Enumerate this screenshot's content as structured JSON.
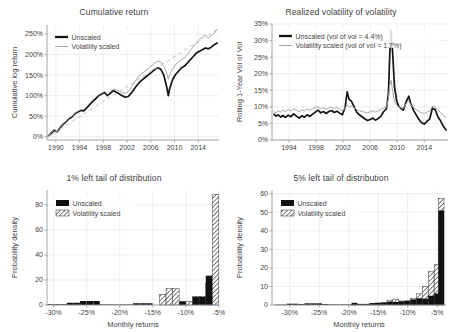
{
  "figure": {
    "panels": [
      "cumulative-return",
      "realized-vol-of-vol",
      "tail-1pct",
      "tail-5pct"
    ]
  },
  "panel_tl": {
    "title": "Cumulative return",
    "ylabel": "Cumulative log return",
    "xlabel": "",
    "legend": [
      "Unscaled",
      "Volatility scaled"
    ],
    "yticks": [
      "0%",
      "50%",
      "100%",
      "150%",
      "200%",
      "250%"
    ],
    "xticks": [
      "1990",
      "1994",
      "1998",
      "2002",
      "2006",
      "2010",
      "2014"
    ]
  },
  "panel_tr": {
    "title": "Realized volatility of volatility",
    "ylabel": "Rolling 1-Year Vol of Vol",
    "xlabel": "",
    "legend": [
      "Unscaled (vol of vol = 4.4%)",
      "Volatility scaled (vol of vol = 1.7%)"
    ],
    "yticks": [
      "0%",
      "5%",
      "10%",
      "15%",
      "20%",
      "25%",
      "30%",
      "35%"
    ],
    "xticks": [
      "1994",
      "1998",
      "2002",
      "2006",
      "2010",
      "2014"
    ]
  },
  "panel_bl": {
    "title": "1% left tail of distribution",
    "ylabel": "Probability density",
    "xlabel": "Monthly returns",
    "legend": [
      "Unscaled",
      "Volatility scaled"
    ],
    "yticks": [
      "0",
      "20",
      "40",
      "60",
      "80"
    ],
    "xticks": [
      "-30%",
      "-25%",
      "-20%",
      "-15%",
      "-10%",
      "-5%"
    ]
  },
  "panel_br": {
    "title": "5% left tail of distribution",
    "ylabel": "Probability density",
    "xlabel": "Monthly returns",
    "legend": [
      "Unscaled",
      "Volatility scaled"
    ],
    "yticks": [
      "0",
      "10",
      "20",
      "30",
      "40",
      "50",
      "60"
    ],
    "xticks": [
      "-30%",
      "-25%",
      "-20%",
      "-15%",
      "-10%",
      "-5%"
    ]
  },
  "chart_data": [
    {
      "id": "cumulative-return",
      "type": "line",
      "title": "Cumulative return",
      "xlabel": "",
      "ylabel": "Cumulative log return",
      "xlim": [
        1988.5,
        2017.5
      ],
      "ylim": [
        -8,
        272
      ],
      "xticks": [
        1990,
        1994,
        1998,
        2002,
        2006,
        2010,
        2014
      ],
      "yticks": [
        0,
        50,
        100,
        150,
        200,
        250
      ],
      "ytick_labels": [
        "0%",
        "50%",
        "100%",
        "150%",
        "200%",
        "250%"
      ],
      "grid": true,
      "legend_position": "upper-left",
      "series": [
        {
          "name": "Unscaled",
          "color": "#131313",
          "x": [
            1988.7,
            1989.2,
            1989.7,
            1990.2,
            1990.7,
            1991.2,
            1991.7,
            1992.2,
            1992.7,
            1993.2,
            1993.7,
            1994.2,
            1994.7,
            1995.2,
            1995.7,
            1996.2,
            1996.7,
            1997.2,
            1997.7,
            1998.2,
            1998.7,
            1999.2,
            1999.7,
            2000.2,
            2000.7,
            2001.2,
            2001.7,
            2002.2,
            2002.7,
            2003.2,
            2003.7,
            2004.2,
            2004.7,
            2005.2,
            2005.7,
            2006.2,
            2006.7,
            2007.2,
            2007.7,
            2008.2,
            2008.7,
            2008.95,
            2009.2,
            2009.7,
            2010.2,
            2010.7,
            2011.2,
            2011.7,
            2012.2,
            2012.7,
            2013.2,
            2013.7,
            2014.2,
            2014.7,
            2015.2,
            2015.7,
            2016.2,
            2016.7,
            2017.2
          ],
          "y": [
            2,
            8,
            16,
            12,
            22,
            30,
            36,
            44,
            48,
            56,
            60,
            64,
            63,
            70,
            78,
            86,
            92,
            100,
            104,
            108,
            100,
            106,
            112,
            108,
            104,
            100,
            96,
            98,
            106,
            116,
            126,
            134,
            140,
            146,
            152,
            158,
            164,
            168,
            164,
            150,
            120,
            100,
            118,
            140,
            152,
            160,
            168,
            172,
            180,
            188,
            196,
            204,
            208,
            212,
            216,
            214,
            218,
            224,
            228
          ]
        },
        {
          "name": "Volatility scaled",
          "color": "#a8a8a8",
          "x": [
            1988.7,
            1989.2,
            1989.7,
            1990.2,
            1990.7,
            1991.2,
            1991.7,
            1992.2,
            1992.7,
            1993.2,
            1993.7,
            1994.2,
            1994.7,
            1995.2,
            1995.7,
            1996.2,
            1996.7,
            1997.2,
            1997.7,
            1998.2,
            1998.7,
            1999.2,
            1999.7,
            2000.2,
            2000.7,
            2001.2,
            2001.7,
            2002.2,
            2002.7,
            2003.2,
            2003.7,
            2004.2,
            2004.7,
            2005.2,
            2005.7,
            2006.2,
            2006.7,
            2007.2,
            2007.7,
            2008.2,
            2008.7,
            2008.95,
            2009.2,
            2009.7,
            2010.2,
            2010.7,
            2011.2,
            2011.7,
            2012.2,
            2012.7,
            2013.2,
            2013.7,
            2014.2,
            2014.7,
            2015.2,
            2015.7,
            2016.2,
            2016.7,
            2017.2
          ],
          "y": [
            3,
            10,
            18,
            14,
            24,
            32,
            38,
            46,
            50,
            58,
            62,
            66,
            66,
            74,
            82,
            90,
            96,
            102,
            106,
            110,
            104,
            110,
            116,
            114,
            110,
            108,
            106,
            110,
            120,
            132,
            142,
            150,
            156,
            162,
            168,
            174,
            180,
            184,
            182,
            172,
            154,
            140,
            152,
            166,
            176,
            182,
            188,
            192,
            200,
            210,
            220,
            228,
            236,
            244,
            248,
            240,
            246,
            252,
            262
          ]
        },
        {
          "name": "trend",
          "color": "#b4b4b4",
          "style": "dashed",
          "x": [
            1988.7,
            2017.3
          ],
          "y": [
            0,
            262
          ]
        }
      ]
    },
    {
      "id": "realized-vol-of-vol",
      "type": "line",
      "title": "Realized volatility of volatility",
      "xlabel": "",
      "ylabel": "Rolling 1-Year Vol of Vol",
      "xlim": [
        1991.5,
        2017.5
      ],
      "ylim": [
        0,
        35
      ],
      "xticks": [
        1994,
        1998,
        2002,
        2006,
        2010,
        2014
      ],
      "yticks": [
        0,
        5,
        10,
        15,
        20,
        25,
        30,
        35
      ],
      "ytick_labels": [
        "0%",
        "5%",
        "10%",
        "15%",
        "20%",
        "25%",
        "30%",
        "35%"
      ],
      "grid": true,
      "legend_position": "upper-left",
      "annotations": {
        "unscaled_vol_of_vol": "4.4%",
        "scaled_vol_of_vol": "1.7%"
      },
      "series": [
        {
          "name": "Unscaled (vol of vol = 4.4%)",
          "color": "#131313",
          "x": [
            1991.8,
            1992.1,
            1992.4,
            1992.8,
            1993.1,
            1993.5,
            1993.9,
            1994.3,
            1994.7,
            1995.1,
            1995.5,
            1995.9,
            1996.3,
            1996.7,
            1997.1,
            1997.5,
            1997.9,
            1998.3,
            1998.7,
            1999.1,
            1999.5,
            1999.9,
            2000.3,
            2000.7,
            2001.1,
            2001.5,
            2001.9,
            2002.3,
            2002.6,
            2002.9,
            2003.2,
            2003.6,
            2004.0,
            2004.4,
            2004.8,
            2005.2,
            2005.6,
            2006.0,
            2006.4,
            2006.8,
            2007.2,
            2007.6,
            2008.0,
            2008.4,
            2008.7,
            2008.9,
            2009.1,
            2009.3,
            2009.6,
            2009.9,
            2010.2,
            2010.5,
            2010.9,
            2011.3,
            2011.7,
            2012.0,
            2012.4,
            2012.8,
            2013.2,
            2013.6,
            2014.0,
            2014.4,
            2014.8,
            2015.2,
            2015.6,
            2016.0,
            2016.4,
            2016.8,
            2017.2
          ],
          "y": [
            7.8,
            7.2,
            7.6,
            6.9,
            7.4,
            6.8,
            7.5,
            7.0,
            7.9,
            7.2,
            6.6,
            7.3,
            6.9,
            7.6,
            7.1,
            7.8,
            8.4,
            9.0,
            8.2,
            8.6,
            8.0,
            8.6,
            8.9,
            8.3,
            8.7,
            8.1,
            7.6,
            9.8,
            14.5,
            12.2,
            11.8,
            10.2,
            8.4,
            7.6,
            7.0,
            6.4,
            5.9,
            6.2,
            6.6,
            6.0,
            6.5,
            7.2,
            8.6,
            9.4,
            14.0,
            26.0,
            33.0,
            27.0,
            16.0,
            12.0,
            10.2,
            9.6,
            9.0,
            11.4,
            13.2,
            11.0,
            9.0,
            7.6,
            6.2,
            5.2,
            4.8,
            5.6,
            6.4,
            9.6,
            9.2,
            7.0,
            5.8,
            4.2,
            3.0
          ]
        },
        {
          "name": "Volatility scaled (vol of vol = 1.7%)",
          "color": "#a8a8a8",
          "x": [
            1991.8,
            1992.1,
            1992.4,
            1992.8,
            1993.1,
            1993.5,
            1993.9,
            1994.3,
            1994.7,
            1995.1,
            1995.5,
            1995.9,
            1996.3,
            1996.7,
            1997.1,
            1997.5,
            1997.9,
            1998.3,
            1998.7,
            1999.1,
            1999.5,
            1999.9,
            2000.3,
            2000.7,
            2001.1,
            2001.5,
            2001.9,
            2002.3,
            2002.6,
            2002.9,
            2003.2,
            2003.6,
            2004.0,
            2004.4,
            2004.8,
            2005.2,
            2005.6,
            2006.0,
            2006.4,
            2006.8,
            2007.2,
            2007.6,
            2008.0,
            2008.4,
            2008.7,
            2008.9,
            2009.1,
            2009.3,
            2009.6,
            2009.9,
            2010.2,
            2010.5,
            2010.9,
            2011.3,
            2011.7,
            2012.0,
            2012.4,
            2012.8,
            2013.2,
            2013.6,
            2014.0,
            2014.4,
            2014.8,
            2015.2,
            2015.6,
            2016.0,
            2016.4,
            2016.8,
            2017.2
          ],
          "y": [
            8.6,
            8.2,
            8.8,
            8.4,
            9.0,
            8.6,
            9.2,
            8.8,
            9.4,
            9.0,
            8.5,
            9.1,
            8.8,
            9.4,
            9.0,
            9.5,
            9.8,
            10.0,
            9.4,
            9.8,
            9.3,
            9.7,
            9.9,
            9.5,
            9.8,
            9.2,
            8.8,
            9.6,
            10.6,
            10.0,
            10.2,
            9.8,
            9.2,
            8.8,
            8.6,
            8.4,
            8.2,
            8.5,
            8.8,
            8.4,
            8.8,
            9.2,
            9.6,
            10.0,
            12.5,
            16.5,
            18.0,
            15.0,
            11.5,
            10.5,
            10.0,
            9.8,
            9.6,
            11.0,
            11.8,
            10.6,
            9.8,
            9.2,
            8.6,
            8.2,
            8.0,
            8.4,
            8.8,
            10.2,
            10.0,
            9.0,
            8.4,
            7.4,
            6.8
          ]
        }
      ]
    },
    {
      "id": "tail-1pct",
      "type": "bar",
      "title": "1% left tail of distribution",
      "xlabel": "Monthly returns",
      "ylabel": "Probability density",
      "xlim": [
        -31,
        -5
      ],
      "ylim": [
        0,
        92
      ],
      "xticks": [
        -30,
        -25,
        -20,
        -15,
        -10,
        -5
      ],
      "xtick_labels": [
        "-30%",
        "-25%",
        "-20%",
        "-15%",
        "-10%",
        "-5%"
      ],
      "yticks": [
        0,
        20,
        40,
        60,
        80
      ],
      "grid": true,
      "legend_position": "upper-left",
      "bin_centers": [
        -30.5,
        -29.5,
        -28.5,
        -27.5,
        -26.5,
        -25.5,
        -24.5,
        -23.5,
        -22.5,
        -21.5,
        -20.5,
        -19.5,
        -18.5,
        -17.5,
        -16.5,
        -15.5,
        -14.5,
        -13.5,
        -12.5,
        -11.5,
        -10.5,
        -9.5,
        -8.5,
        -7.5,
        -6.5,
        -5.5
      ],
      "series": [
        {
          "name": "Unscaled",
          "style": "solid",
          "values": [
            0.6,
            0.6,
            0.6,
            1.8,
            1.8,
            3.2,
            3.2,
            3.2,
            0.5,
            0.4,
            0.4,
            0.4,
            0.4,
            1.4,
            1.4,
            1.4,
            0,
            0,
            0,
            0,
            3.0,
            0,
            6.5,
            6.5,
            23.5,
            0
          ]
        },
        {
          "name": "Volatility scaled",
          "style": "hatched",
          "values": [
            0,
            0,
            0,
            0,
            0,
            0,
            0,
            0,
            0,
            0,
            0,
            0,
            0,
            0,
            0,
            0,
            0,
            8.5,
            13.0,
            13.0,
            2.0,
            3.0,
            7.0,
            7.0,
            17.5,
            88.5
          ]
        }
      ]
    },
    {
      "id": "tail-5pct",
      "type": "bar",
      "title": "5% left tail of distribution",
      "xlabel": "Monthly returns",
      "ylabel": "Probability density",
      "xlim": [
        -33,
        -3.5
      ],
      "ylim": [
        0,
        62
      ],
      "xticks": [
        -30,
        -25,
        -20,
        -15,
        -10,
        -5
      ],
      "xtick_labels": [
        "-30%",
        "-25%",
        "-20%",
        "-15%",
        "-10%",
        "-5%"
      ],
      "yticks": [
        0,
        10,
        20,
        30,
        40,
        50,
        60
      ],
      "grid": true,
      "legend_position": "upper-left",
      "bin_centers": [
        -32,
        -31,
        -30,
        -29,
        -28,
        -27,
        -26,
        -25,
        -24,
        -23,
        -22,
        -21,
        -20,
        -19,
        -18,
        -17,
        -16,
        -15,
        -14,
        -13,
        -12,
        -11,
        -10,
        -9,
        -8,
        -7,
        -6,
        -5,
        -4.3
      ],
      "series": [
        {
          "name": "Unscaled",
          "style": "solid",
          "values": [
            0.2,
            0.2,
            0.7,
            0.7,
            0.5,
            0.9,
            0.9,
            0.9,
            0.5,
            0.3,
            0.3,
            0.3,
            0.3,
            1.2,
            0.6,
            0.6,
            1.0,
            1.2,
            1.3,
            1.8,
            1.6,
            2.0,
            2.4,
            3.0,
            3.6,
            3.4,
            5.0,
            6.2,
            51.0
          ]
        },
        {
          "name": "Volatility scaled",
          "style": "hatched",
          "values": [
            0,
            0,
            0,
            0,
            0,
            0,
            0,
            0,
            0,
            0,
            0,
            0,
            0,
            0.2,
            0.3,
            0.4,
            0.6,
            1.0,
            1.4,
            2.6,
            3.2,
            2.2,
            2.0,
            3.4,
            6.0,
            10.0,
            18.0,
            22.0,
            57.5
          ]
        }
      ]
    }
  ]
}
